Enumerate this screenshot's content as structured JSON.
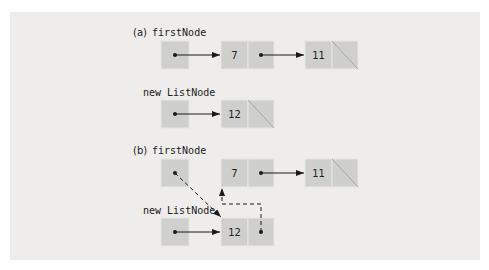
{
  "figure": {
    "part_a": {
      "tag": "(a)",
      "first_label": "firstNode",
      "new_label": "new ListNode",
      "list_nodes": [
        {
          "value": "7"
        },
        {
          "value": "11",
          "next": "null"
        }
      ],
      "new_node": {
        "value": "12",
        "next": "null"
      }
    },
    "part_b": {
      "tag": "(b)",
      "first_label": "firstNode",
      "new_label": "new ListNode",
      "list_nodes": [
        {
          "value": "7"
        },
        {
          "value": "11",
          "next": "null"
        }
      ],
      "new_node": {
        "value": "12",
        "next": "7"
      }
    },
    "colors": {
      "panel": "#eeedeb",
      "box": "#cfcfcd",
      "ink": "#1a1a1a"
    }
  }
}
